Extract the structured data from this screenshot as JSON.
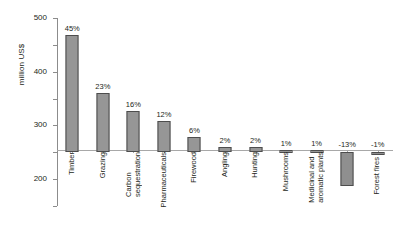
{
  "chart_data": {
    "type": "bar",
    "title": "",
    "xlabel": "",
    "ylabel": "million US$",
    "ylim": [
      -200,
      500
    ],
    "yticks": [
      500,
      400,
      300,
      200,
      100,
      0,
      -100,
      -200
    ],
    "ytick_labels": [
      "500",
      "400",
      "300",
      "200",
      "100",
      "0",
      "-100",
      "-200"
    ],
    "grid": false,
    "legend": "none",
    "categories": [
      "Timber",
      "Grazing",
      "Carbon\nsequestration",
      "Pharmaceuticals",
      "Firewood",
      "Angling",
      "Hunting",
      "Mushrooms",
      "Medicinal and\naromatic plants",
      "Erosion",
      "Forest fires"
    ],
    "values": [
      435,
      222,
      155,
      116,
      58,
      19,
      18,
      10,
      10,
      -125,
      -10
    ],
    "data_labels": [
      "45%",
      "23%",
      "16%",
      "12%",
      "6%",
      "2%",
      "2%",
      "1%",
      "1%",
      "-13%",
      "-1%"
    ],
    "label_position": [
      "above",
      "above",
      "above",
      "above",
      "above",
      "above",
      "above",
      "above",
      "above",
      "above",
      "above"
    ],
    "series_color": "#969696",
    "bar_border_color": "#4d4d4d",
    "axis_color": "#8c8c8c"
  }
}
